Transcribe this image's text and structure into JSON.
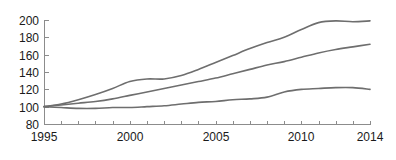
{
  "chart_data": {
    "type": "line",
    "title": "",
    "subtitle": "",
    "xlabel": "",
    "ylabel": "",
    "xlim": [
      1995,
      2014
    ],
    "ylim": [
      80,
      200
    ],
    "grid": false,
    "legend": null,
    "x_tick_labels": [
      "1995",
      "2000",
      "2005",
      "2010",
      "2014"
    ],
    "x_tick_values": [
      1995,
      2000,
      2005,
      2010,
      2014
    ],
    "x_minor_ticks": [
      1996,
      1997,
      1998,
      1999,
      2001,
      2002,
      2003,
      2004,
      2006,
      2007,
      2008,
      2009,
      2011,
      2012,
      2013
    ],
    "y_tick_labels": [
      "80",
      "100",
      "120",
      "140",
      "160",
      "180",
      "200"
    ],
    "y_tick_values": [
      80,
      100,
      120,
      140,
      160,
      180,
      200
    ],
    "x": [
      1995,
      1996,
      1997,
      1998,
      1999,
      2000,
      2001,
      2002,
      2003,
      2004,
      2005,
      2006,
      2007,
      2008,
      2009,
      2010,
      2011,
      2012,
      2013,
      2014
    ],
    "series": [
      {
        "name": "upper-series",
        "color": "#6e6e6e",
        "values": [
          100,
          103,
          108,
          114,
          121,
          129,
          132,
          132,
          136,
          143,
          151,
          159,
          167,
          174,
          180,
          189,
          197,
          199,
          198,
          199
        ]
      },
      {
        "name": "middle-series",
        "color": "#6e6e6e",
        "values": [
          100,
          102,
          104,
          106,
          109,
          113,
          117,
          121,
          125,
          129,
          133,
          138,
          143,
          148,
          152,
          157,
          162,
          166,
          169,
          172
        ]
      },
      {
        "name": "lower-series",
        "color": "#6e6e6e",
        "values": [
          100,
          99,
          98,
          98,
          99,
          99,
          100,
          101,
          103,
          105,
          106,
          108,
          109,
          111,
          117,
          120,
          121,
          122,
          122,
          120
        ]
      }
    ]
  },
  "plot_geometry": {
    "left": 44,
    "right": 370,
    "top": 20,
    "bottom": 124
  }
}
